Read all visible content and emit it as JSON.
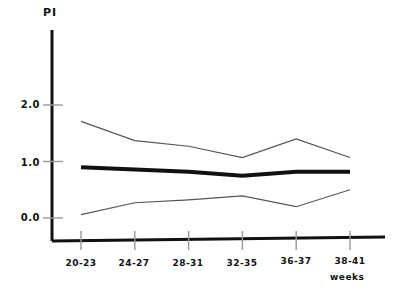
{
  "chart_data": {
    "type": "line",
    "title": "",
    "xlabel": "weeks",
    "ylabel": "PI",
    "categories": [
      "20-23",
      "24-27",
      "28-31",
      "32-35",
      "36-37",
      "38-41"
    ],
    "ytick_labels": [
      "2.0",
      "1.0",
      "0.0"
    ],
    "ytick_values": [
      2.0,
      1.0,
      0.0
    ],
    "ylim": [
      -0.35,
      2.5
    ],
    "xlim": [
      0,
      5
    ],
    "grid": false,
    "legend": "none",
    "series": [
      {
        "name": "upper",
        "style": "thin",
        "values": [
          1.71,
          1.37,
          1.27,
          1.07,
          1.4,
          1.07
        ]
      },
      {
        "name": "mean",
        "style": "thick",
        "values": [
          0.9,
          0.86,
          0.82,
          0.75,
          0.82,
          0.82
        ]
      },
      {
        "name": "lower",
        "style": "thin",
        "values": [
          0.06,
          0.27,
          0.32,
          0.39,
          0.2,
          0.5
        ]
      }
    ]
  },
  "colors": {
    "axis": "#111111",
    "line_thick": "#111111",
    "line_thin": "#555555",
    "tick": "#999999",
    "background": "#ffffff"
  }
}
